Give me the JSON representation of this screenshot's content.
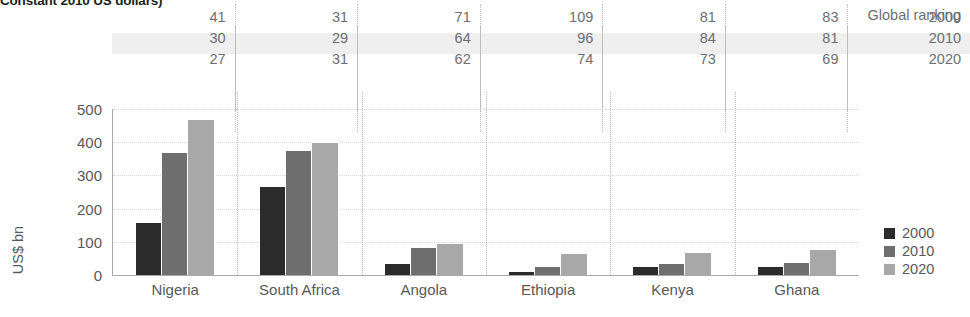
{
  "subtitle": "Constant 2010 US dollars)",
  "ranking_table": {
    "header_label": "Global ranking",
    "row_years": [
      "2000",
      "2010",
      "2020"
    ],
    "rows": [
      [
        "41",
        "31",
        "71",
        "109",
        "81",
        "83"
      ],
      [
        "30",
        "29",
        "64",
        "96",
        "84",
        "81"
      ],
      [
        "27",
        "31",
        "62",
        "74",
        "73",
        "69"
      ]
    ]
  },
  "legend": {
    "items": [
      {
        "label": "2000",
        "color": "#2b2b2b"
      },
      {
        "label": "2010",
        "color": "#6e6e6e"
      },
      {
        "label": "2020",
        "color": "#a8a8a8"
      }
    ]
  },
  "chart_data": {
    "type": "bar",
    "title": "Constant 2010 US dollars)",
    "xlabel": "",
    "ylabel": "US$ bn",
    "ylim": [
      0,
      500
    ],
    "yticks": [
      0,
      100,
      200,
      300,
      400,
      500
    ],
    "ytick_labels": [
      "0",
      "100",
      "200",
      "300",
      "400",
      "500"
    ],
    "grid": true,
    "legend_position": "right",
    "categories": [
      "Nigeria",
      "South Africa",
      "Angola",
      "Ethiopia",
      "Kenya",
      "Ghana"
    ],
    "series": [
      {
        "name": "2000",
        "color": "#2b2b2b",
        "values": [
          160,
          267,
          37,
          11,
          27,
          26
        ]
      },
      {
        "name": "2010",
        "color": "#6e6e6e",
        "values": [
          370,
          378,
          85,
          28,
          37,
          40
        ]
      },
      {
        "name": "2020",
        "color": "#a8a8a8",
        "values": [
          470,
          402,
          95,
          65,
          68,
          79
        ]
      }
    ],
    "global_ranking": {
      "years": [
        "2000",
        "2010",
        "2020"
      ],
      "Nigeria": [
        41,
        30,
        27
      ],
      "South Africa": [
        31,
        29,
        31
      ],
      "Angola": [
        71,
        64,
        62
      ],
      "Ethiopia": [
        109,
        96,
        74
      ],
      "Kenya": [
        81,
        84,
        73
      ],
      "Ghana": [
        83,
        81,
        69
      ]
    }
  }
}
